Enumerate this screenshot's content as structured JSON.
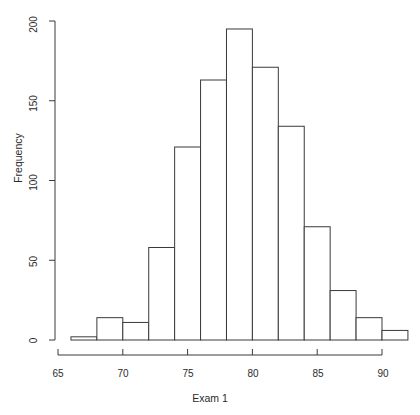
{
  "chart_data": {
    "type": "bar",
    "subtype": "histogram",
    "title": "",
    "xlabel": "Exam 1",
    "ylabel": "Frequency",
    "xlim": [
      66,
      92
    ],
    "ylim": [
      0,
      200
    ],
    "grid": false,
    "legend": null,
    "bin_width": 2,
    "bin_edges": [
      66,
      68,
      70,
      72,
      74,
      76,
      78,
      80,
      82,
      84,
      86,
      88,
      90,
      92
    ],
    "categories": [
      "66-68",
      "68-70",
      "70-72",
      "72-74",
      "74-76",
      "76-78",
      "78-80",
      "80-82",
      "82-84",
      "84-86",
      "86-88",
      "88-90",
      "90-92"
    ],
    "values": [
      2,
      14,
      11,
      58,
      121,
      163,
      195,
      171,
      134,
      71,
      31,
      14,
      6
    ],
    "x_ticks": [
      65,
      70,
      75,
      80,
      85,
      90
    ],
    "x_tick_labels": [
      "65",
      "70",
      "75",
      "80",
      "85",
      "90"
    ],
    "y_ticks": [
      0,
      50,
      100,
      150,
      200
    ],
    "y_tick_labels": [
      "0",
      "50",
      "100",
      "150",
      "200"
    ],
    "bar_fill": "#ffffff",
    "bar_stroke": "#3a3a3a",
    "axis_color": "#3a3a3a",
    "background": "#ffffff"
  }
}
